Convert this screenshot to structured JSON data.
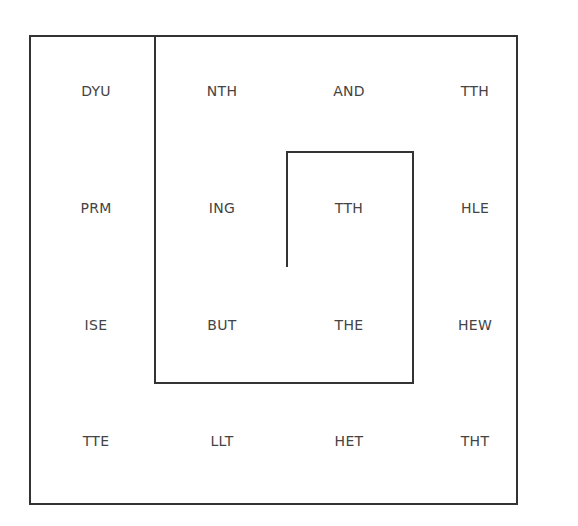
{
  "grid": {
    "rows": [
      [
        "DYU",
        "NTH",
        "AND",
        "TTH"
      ],
      [
        "PRM",
        "ING",
        "TTH",
        "HLE"
      ],
      [
        "ISE",
        "BUT",
        "THE",
        "HEW"
      ],
      [
        "TTE",
        "LLT",
        "HET",
        "THT"
      ]
    ]
  },
  "colors": {
    "line": "#333333",
    "text": "#444444",
    "background": "#ffffff"
  }
}
